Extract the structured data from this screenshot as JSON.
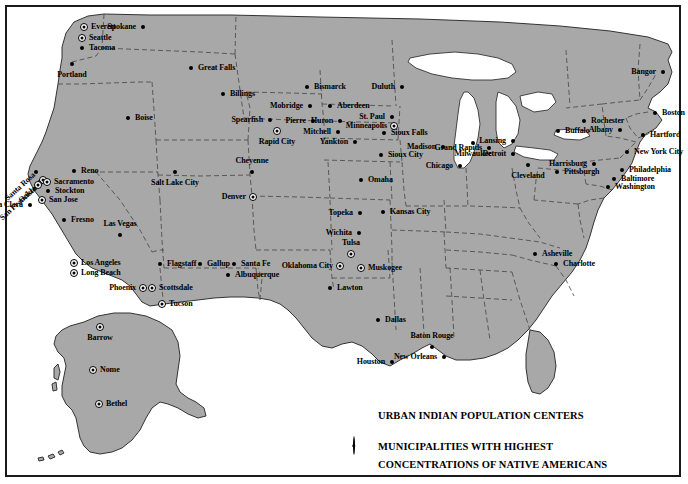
{
  "map": {
    "title": "Urban Indian Population Centers and Municipalities with Highest Concentrations of Native Americans",
    "land_color": "#a8a8a8",
    "water_color": "#ffffff",
    "border_color": "#1a1a1a",
    "marker_color": "#000000"
  },
  "legend": {
    "items": [
      {
        "marker": "dot",
        "label": "URBAN INDIAN POPULATION CENTERS"
      },
      {
        "marker": "ring",
        "label": "MUNICIPALITIES WITH HIGHEST\nCONCENTRATIONS OF NATIVE AMERICANS"
      }
    ],
    "entry_1_line_1": "URBAN INDIAN POPULATION CENTERS",
    "entry_2_line_1": "MUNICIPALITIES WITH HIGHEST",
    "entry_2_line_2": "CONCENTRATIONS OF NATIVE AMERICANS"
  },
  "cities": [
    {
      "name": "Everett",
      "x": 84,
      "y": 27,
      "marker": "ring",
      "pos": "right"
    },
    {
      "name": "Spokane",
      "x": 143,
      "y": 27,
      "marker": "dot",
      "pos": "left"
    },
    {
      "name": "Seattle",
      "x": 82,
      "y": 38,
      "marker": "ring",
      "pos": "right"
    },
    {
      "name": "Tacoma",
      "x": 82,
      "y": 48,
      "marker": "dot",
      "pos": "right"
    },
    {
      "name": "Portland",
      "x": 72,
      "y": 64,
      "marker": "dot",
      "pos": "below"
    },
    {
      "name": "Great Falls",
      "x": 191,
      "y": 68,
      "marker": "dot",
      "pos": "right"
    },
    {
      "name": "Bismarck",
      "x": 307,
      "y": 87,
      "marker": "dot",
      "pos": "right"
    },
    {
      "name": "Duluth",
      "x": 402,
      "y": 87,
      "marker": "dot",
      "pos": "left"
    },
    {
      "name": "Billings",
      "x": 223,
      "y": 94,
      "marker": "dot",
      "pos": "right"
    },
    {
      "name": "Mobridge",
      "x": 310,
      "y": 106,
      "marker": "dot",
      "pos": "left"
    },
    {
      "name": "Aberdeen",
      "x": 330,
      "y": 106,
      "marker": "dot",
      "pos": "right"
    },
    {
      "name": "Boise",
      "x": 128,
      "y": 118,
      "marker": "dot",
      "pos": "right"
    },
    {
      "name": "Pierre",
      "x": 313,
      "y": 121,
      "marker": "dot",
      "pos": "left"
    },
    {
      "name": "Huron",
      "x": 340,
      "y": 121,
      "marker": "dot",
      "pos": "left"
    },
    {
      "name": "St. Paul",
      "x": 392,
      "y": 117,
      "marker": "dot",
      "pos": "left"
    },
    {
      "name": "Spearfish",
      "x": 270,
      "y": 120,
      "marker": "dot",
      "pos": "left"
    },
    {
      "name": "Minneapolis",
      "x": 394,
      "y": 126,
      "marker": "ring",
      "pos": "left"
    },
    {
      "name": "Rapid City",
      "x": 277,
      "y": 131,
      "marker": "ring",
      "pos": "below"
    },
    {
      "name": "Mitchell",
      "x": 338,
      "y": 132,
      "marker": "dot",
      "pos": "left"
    },
    {
      "name": "Sioux Falls",
      "x": 384,
      "y": 133,
      "marker": "dot",
      "pos": "right"
    },
    {
      "name": "Madison",
      "x": 443,
      "y": 147,
      "marker": "dot",
      "pos": "left"
    },
    {
      "name": "Milwaukee",
      "x": 473,
      "y": 143,
      "marker": "dot",
      "pos": "below"
    },
    {
      "name": "Lansing",
      "x": 513,
      "y": 141,
      "marker": "dot",
      "pos": "left"
    },
    {
      "name": "Yankton",
      "x": 355,
      "y": 142,
      "marker": "dot",
      "pos": "left"
    },
    {
      "name": "Rochester",
      "x": 584,
      "y": 121,
      "marker": "dot",
      "pos": "right"
    },
    {
      "name": "Albany",
      "x": 620,
      "y": 130,
      "marker": "dot",
      "pos": "left"
    },
    {
      "name": "Bangor",
      "x": 663,
      "y": 72,
      "marker": "dot",
      "pos": "left"
    },
    {
      "name": "Boston",
      "x": 655,
      "y": 113,
      "marker": "dot",
      "pos": "right"
    },
    {
      "name": "Buffalo",
      "x": 558,
      "y": 131,
      "marker": "dot",
      "pos": "right"
    },
    {
      "name": "Hartford",
      "x": 643,
      "y": 135,
      "marker": "dot",
      "pos": "right"
    },
    {
      "name": "Grand Rapids",
      "x": 489,
      "y": 148,
      "marker": "dot",
      "pos": "left"
    },
    {
      "name": "Detroit",
      "x": 513,
      "y": 154,
      "marker": "dot",
      "pos": "left"
    },
    {
      "name": "Sioux City",
      "x": 381,
      "y": 155,
      "marker": "dot",
      "pos": "right"
    },
    {
      "name": "New York City",
      "x": 627,
      "y": 152,
      "marker": "dot",
      "pos": "right"
    },
    {
      "name": "Chicago",
      "x": 460,
      "y": 166,
      "marker": "dot",
      "pos": "left"
    },
    {
      "name": "Cleveland",
      "x": 528,
      "y": 165,
      "marker": "dot",
      "pos": "below"
    },
    {
      "name": "Harrisburg",
      "x": 594,
      "y": 164,
      "marker": "dot",
      "pos": "left"
    },
    {
      "name": "Pittsburgh",
      "x": 557,
      "y": 172,
      "marker": "dot",
      "pos": "right"
    },
    {
      "name": "Philadelphia",
      "x": 622,
      "y": 170,
      "marker": "dot",
      "pos": "right"
    },
    {
      "name": "Baltimore",
      "x": 614,
      "y": 179,
      "marker": "dot",
      "pos": "right"
    },
    {
      "name": "Washington",
      "x": 608,
      "y": 187,
      "marker": "dot",
      "pos": "right"
    },
    {
      "name": "Cheyenne",
      "x": 252,
      "y": 172,
      "marker": "dot",
      "pos": "above"
    },
    {
      "name": "Salt Lake City",
      "x": 175,
      "y": 172,
      "marker": "dot",
      "pos": "below"
    },
    {
      "name": "Omaha",
      "x": 361,
      "y": 180,
      "marker": "dot",
      "pos": "right"
    },
    {
      "name": "Reno",
      "x": 74,
      "y": 171,
      "marker": "dot",
      "pos": "right"
    },
    {
      "name": "Santa Rosa",
      "x": 36,
      "y": 172,
      "marker": "dot",
      "pos": "diag"
    },
    {
      "name": "Oakland",
      "x": 43,
      "y": 180,
      "marker": "ring",
      "pos": "diag"
    },
    {
      "name": "Sacramento",
      "x": 47,
      "y": 182,
      "marker": "ring",
      "pos": "right"
    },
    {
      "name": "San Francisco",
      "x": 38,
      "y": 185,
      "marker": "ring",
      "pos": "diag"
    },
    {
      "name": "Stockton",
      "x": 48,
      "y": 191,
      "marker": "dot",
      "pos": "right"
    },
    {
      "name": "Denver",
      "x": 253,
      "y": 197,
      "marker": "ring",
      "pos": "left"
    },
    {
      "name": "San Jose",
      "x": 42,
      "y": 200,
      "marker": "ring",
      "pos": "right"
    },
    {
      "name": "Santa Clara",
      "x": 30,
      "y": 205,
      "marker": "dot",
      "pos": "left"
    },
    {
      "name": "Topeka",
      "x": 360,
      "y": 213,
      "marker": "dot",
      "pos": "left"
    },
    {
      "name": "Kansas City",
      "x": 383,
      "y": 212,
      "marker": "dot",
      "pos": "right"
    },
    {
      "name": "Fresno",
      "x": 64,
      "y": 220,
      "marker": "dot",
      "pos": "right"
    },
    {
      "name": "Wichita",
      "x": 359,
      "y": 233,
      "marker": "dot",
      "pos": "left"
    },
    {
      "name": "Las Vegas",
      "x": 120,
      "y": 235,
      "marker": "dot",
      "pos": "above"
    },
    {
      "name": "Tulsa",
      "x": 351,
      "y": 254,
      "marker": "ring",
      "pos": "above"
    },
    {
      "name": "Asheville",
      "x": 535,
      "y": 254,
      "marker": "dot",
      "pos": "right"
    },
    {
      "name": "Flagstaff",
      "x": 160,
      "y": 264,
      "marker": "dot",
      "pos": "right"
    },
    {
      "name": "Gallup",
      "x": 200,
      "y": 264,
      "marker": "dot",
      "pos": "right"
    },
    {
      "name": "Santa Fe",
      "x": 234,
      "y": 264,
      "marker": "dot",
      "pos": "right"
    },
    {
      "name": "Oklahoma City",
      "x": 340,
      "y": 266,
      "marker": "ring",
      "pos": "left"
    },
    {
      "name": "Muskogee",
      "x": 361,
      "y": 268,
      "marker": "ring",
      "pos": "right"
    },
    {
      "name": "Charlotte",
      "x": 556,
      "y": 264,
      "marker": "dot",
      "pos": "right"
    },
    {
      "name": "Los Angeles",
      "x": 74,
      "y": 263,
      "marker": "ring",
      "pos": "right"
    },
    {
      "name": "Long Beach",
      "x": 74,
      "y": 273,
      "marker": "ring",
      "pos": "right"
    },
    {
      "name": "Albuquerque",
      "x": 228,
      "y": 275,
      "marker": "dot",
      "pos": "right"
    },
    {
      "name": "Phoenix",
      "x": 143,
      "y": 288,
      "marker": "ring",
      "pos": "left"
    },
    {
      "name": "Scottsdale",
      "x": 152,
      "y": 288,
      "marker": "ring",
      "pos": "right"
    },
    {
      "name": "Lawton",
      "x": 330,
      "y": 288,
      "marker": "dot",
      "pos": "right"
    },
    {
      "name": "Tucson",
      "x": 162,
      "y": 304,
      "marker": "ring",
      "pos": "right"
    },
    {
      "name": "Barrow",
      "x": 100,
      "y": 327,
      "marker": "ring",
      "pos": "below"
    },
    {
      "name": "Dallas",
      "x": 378,
      "y": 320,
      "marker": "dot",
      "pos": "right"
    },
    {
      "name": "Baton Rouge",
      "x": 432,
      "y": 347,
      "marker": "dot",
      "pos": "above"
    },
    {
      "name": "New Orleans",
      "x": 444,
      "y": 357,
      "marker": "dot",
      "pos": "left"
    },
    {
      "name": "Houston",
      "x": 392,
      "y": 362,
      "marker": "dot",
      "pos": "left"
    },
    {
      "name": "Nome",
      "x": 93,
      "y": 370,
      "marker": "ring",
      "pos": "right"
    },
    {
      "name": "Bethel",
      "x": 99,
      "y": 404,
      "marker": "ring",
      "pos": "right"
    }
  ]
}
